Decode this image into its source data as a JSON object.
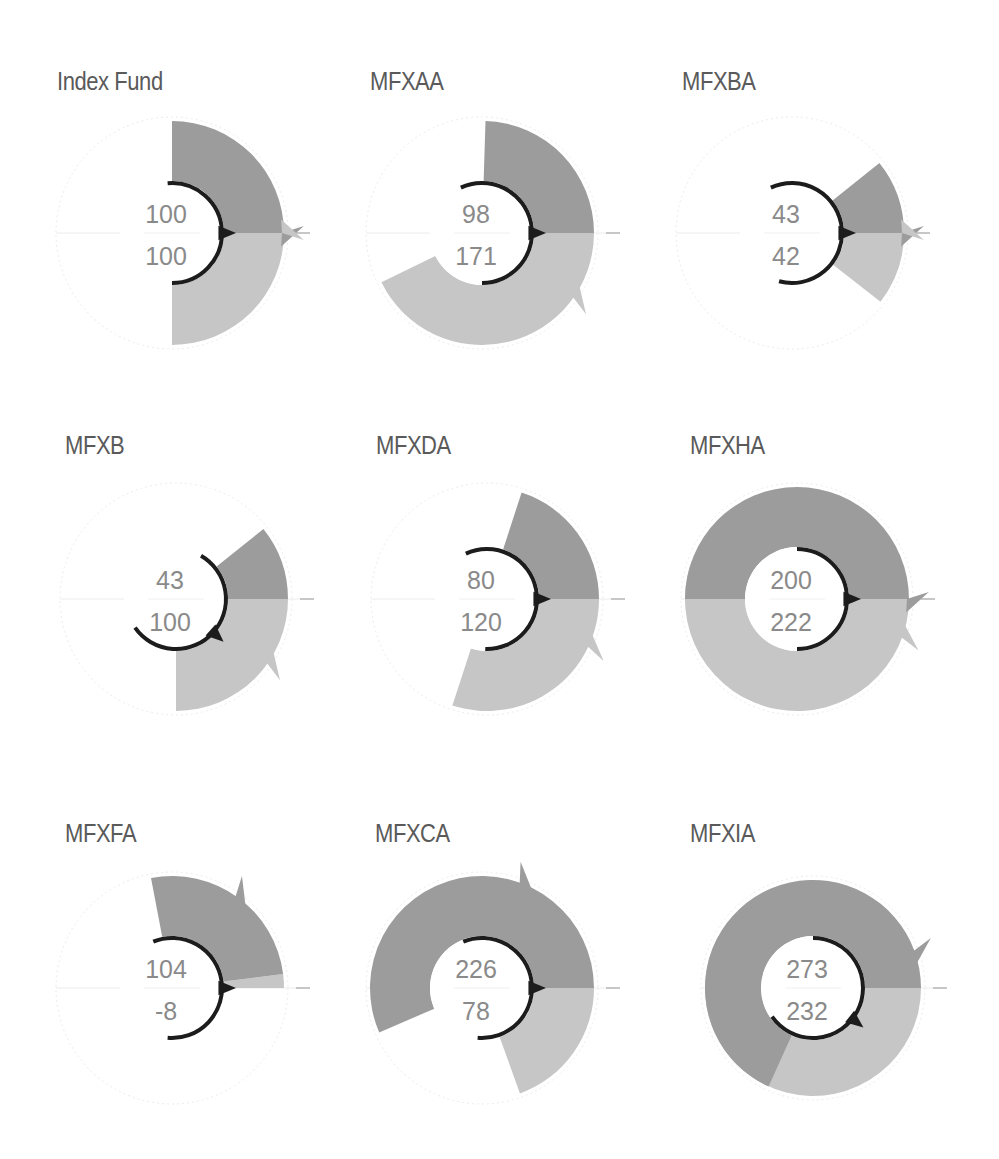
{
  "colors": {
    "series1": "#9c9c9c",
    "series2": "#c6c6c6",
    "indicator": "#1c1c1c",
    "guide": "#ececec",
    "title": "#5a5a5a",
    "value_top": "#8a8a8a",
    "value_bottom": "#8a8a8a"
  },
  "panels": [
    {
      "title": "Index Fund",
      "top": "100",
      "bottom": "100"
    },
    {
      "title": "MFXAA",
      "top": "98",
      "bottom": "171"
    },
    {
      "title": "MFXBA",
      "top": "43",
      "bottom": "42"
    },
    {
      "title": "MFXB",
      "top": "43",
      "bottom": "100"
    },
    {
      "title": "MFXDA",
      "top": "80",
      "bottom": "120"
    },
    {
      "title": "MFXHA",
      "top": "200",
      "bottom": "222"
    },
    {
      "title": "MFXFA",
      "top": "104",
      "bottom": "-8"
    },
    {
      "title": "MFXCA",
      "top": "226",
      "bottom": "78"
    },
    {
      "title": "MFXIA",
      "top": "273",
      "bottom": "232"
    }
  ],
  "chart_data": {
    "type": "radial-bar",
    "title": "",
    "scale_note": "angle in degrees = value x 0.9 (100 = quarter turn), measured from 3 o'clock; series 1 counter-clockwise, series 2 clockwise",
    "legend": [],
    "categories": [
      "Index Fund",
      "MFXAA",
      "MFXBA",
      "MFXB",
      "MFXDA",
      "MFXHA",
      "MFXFA",
      "MFXCA",
      "MFXIA"
    ],
    "series": [
      {
        "name": "upper value (dark wedge)",
        "values": [
          100,
          98,
          43,
          43,
          80,
          200,
          104,
          226,
          273
        ]
      },
      {
        "name": "lower value (light wedge)",
        "values": [
          100,
          171,
          42,
          100,
          120,
          222,
          -8,
          78,
          232
        ]
      }
    ],
    "geometry": [
      {
        "cx": 172,
        "cy": 233,
        "r_in": 52,
        "r_out": 112,
        "notch1": 0,
        "notch2": 0,
        "arc_from": -95,
        "arc_to": 90,
        "arrow": 0
      },
      {
        "cx": 482,
        "cy": 233,
        "r_in": 52,
        "r_out": 112,
        "notch1": 0,
        "notch2": 35,
        "arc_from": -115,
        "arc_to": 90,
        "arrow": 0
      },
      {
        "cx": 792,
        "cy": 233,
        "r_in": 52,
        "r_out": 112,
        "notch1": 0,
        "notch2": 0,
        "arc_from": -115,
        "arc_to": 105,
        "arrow": 0
      },
      {
        "cx": 176,
        "cy": 599,
        "r_in": 52,
        "r_out": 112,
        "notch1": 0,
        "notch2": 35,
        "arc_from": -60,
        "arc_to": 145,
        "arrow": 42
      },
      {
        "cx": 487,
        "cy": 599,
        "r_in": 52,
        "r_out": 112,
        "notch1": 0,
        "notch2": 25,
        "arc_from": -115,
        "arc_to": 92,
        "arrow": 0
      },
      {
        "cx": 797,
        "cy": 599,
        "r_in": 52,
        "r_out": 112,
        "notch1": 0,
        "notch2": 20,
        "arc_from": -90,
        "arc_to": 90,
        "arrow": 0
      },
      {
        "cx": 172,
        "cy": 988,
        "r_in": 52,
        "r_out": 112,
        "notch1": -55,
        "notch2": 0,
        "arc_from": -112,
        "arc_to": 95,
        "arrow": 0
      },
      {
        "cx": 482,
        "cy": 988,
        "r_in": 52,
        "r_out": 112,
        "notch1": -70,
        "notch2": 0,
        "arc_from": -112,
        "arc_to": 95,
        "arrow": 0
      },
      {
        "cx": 813,
        "cy": 988,
        "r_in": 52,
        "r_out": 108,
        "notch1": -20,
        "notch2": 0,
        "arc_from": -90,
        "arc_to": 145,
        "arrow": 38
      }
    ]
  }
}
